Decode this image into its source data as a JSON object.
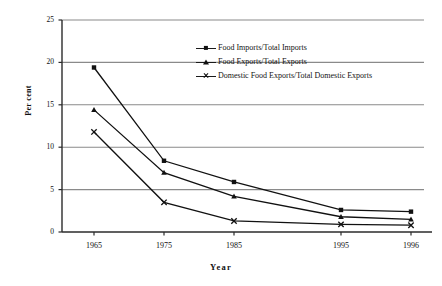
{
  "chart_data": {
    "type": "line",
    "title": "",
    "xlabel": "Year",
    "ylabel": "Per cent",
    "categories": [
      "1965",
      "1975",
      "1985",
      "1995",
      "1996"
    ],
    "xticklabels": [
      "1965",
      "1975",
      "1985",
      "1995",
      "1996"
    ],
    "yticklabels": [
      "0",
      "5",
      "10",
      "15",
      "20",
      "25"
    ],
    "yticks": [
      0,
      5,
      10,
      15,
      20,
      25
    ],
    "ylim": [
      0,
      25
    ],
    "grid": "horizontal",
    "legend_position": "upper-center",
    "series": [
      {
        "name": "Food Imports/Total Imports",
        "marker": "square",
        "values": [
          19.4,
          8.4,
          5.9,
          2.6,
          2.4
        ]
      },
      {
        "name": "Food Exports/Total Exports",
        "marker": "triangle",
        "values": [
          14.4,
          7.0,
          4.2,
          1.8,
          1.5
        ]
      },
      {
        "name": "Domestic Food Exports/Total Domestic Exports",
        "marker": "x",
        "values": [
          11.8,
          3.5,
          1.3,
          0.9,
          0.8
        ]
      }
    ]
  },
  "colors": {
    "line": "#111111",
    "grid": "#8a8a8a",
    "axis": "#2b2b2b",
    "background": "#ffffff"
  }
}
